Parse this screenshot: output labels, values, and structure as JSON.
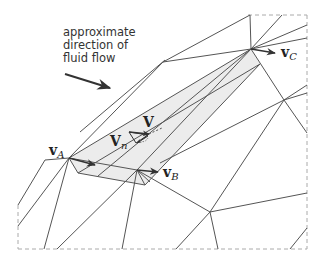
{
  "caption": {
    "line1": "approximate",
    "line2": "direction of",
    "line3": "fluid flow"
  },
  "labels": {
    "vA": {
      "main": "v",
      "sub": "A"
    },
    "vB": {
      "main": "v",
      "sub": "B"
    },
    "vC": {
      "main": "v",
      "sub": "C"
    },
    "V": {
      "main": "V",
      "sub": ""
    },
    "Vn": {
      "main": "V",
      "sub": "n"
    }
  },
  "colors": {
    "line": "#555555",
    "shade": "#ececec",
    "dashed": "#aaaaaa",
    "arrow": "#333333"
  }
}
